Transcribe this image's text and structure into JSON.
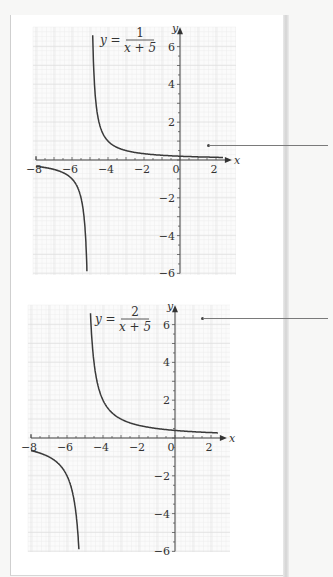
{
  "chart_data": [
    {
      "type": "line",
      "title": "",
      "equation_label": {
        "lhs": "y =",
        "numerator": "1",
        "denominator": "x + 5"
      },
      "function": "y = 1/(x+5)",
      "xlabel": "x",
      "ylabel": "y",
      "xlim": [
        -8,
        2.4
      ],
      "ylim": [
        -6,
        6.5
      ],
      "x_ticks": [
        -8,
        -6,
        -4,
        -2,
        0,
        2
      ],
      "x_tick_labels": [
        "−8",
        "−6",
        "−4",
        "−2",
        "0",
        "2"
      ],
      "y_ticks": [
        6,
        4,
        2,
        -2,
        -4,
        -6
      ],
      "y_tick_labels": [
        "6",
        "4",
        "2",
        "−2",
        "−4",
        "−6"
      ],
      "grid": true,
      "vertical_asymptote": -5,
      "horizontal_asymptote": 0,
      "series": [
        {
          "name": "right branch",
          "x": [
            -4.85,
            -4.8,
            -4.7,
            -4.5,
            -4,
            -3,
            -2,
            -1,
            0,
            1,
            2,
            2.4
          ],
          "y": [
            6.67,
            5,
            3.33,
            2,
            1,
            0.5,
            0.33,
            0.25,
            0.2,
            0.17,
            0.14,
            0.14
          ]
        },
        {
          "name": "left branch",
          "x": [
            -8,
            -7,
            -6,
            -5.5,
            -5.3,
            -5.2,
            -5.17
          ],
          "y": [
            -0.33,
            -0.5,
            -1,
            -2,
            -3.33,
            -5,
            -6
          ]
        }
      ]
    },
    {
      "type": "line",
      "title": "",
      "equation_label": {
        "lhs": "y =",
        "numerator": "2",
        "denominator": "x + 5"
      },
      "function": "y = 2/(x+5)",
      "xlabel": "x",
      "ylabel": "y",
      "xlim": [
        -8,
        2.4
      ],
      "ylim": [
        -6,
        6.5
      ],
      "x_ticks": [
        -8,
        -6,
        -4,
        -2,
        0,
        2
      ],
      "x_tick_labels": [
        "−8",
        "−6",
        "−4",
        "−2",
        "0",
        "2"
      ],
      "y_ticks": [
        6,
        4,
        2,
        -2,
        -4,
        -6
      ],
      "y_tick_labels": [
        "6",
        "4",
        "2",
        "−2",
        "−4",
        "−6"
      ],
      "grid": true,
      "vertical_asymptote": -5,
      "horizontal_asymptote": 0,
      "series": [
        {
          "name": "right branch",
          "x": [
            -4.69,
            -4.6,
            -4.5,
            -4,
            -3,
            -2,
            -1,
            0,
            1,
            2,
            2.4
          ],
          "y": [
            6.5,
            5,
            4,
            2,
            1,
            0.67,
            0.5,
            0.4,
            0.33,
            0.29,
            0.27
          ]
        },
        {
          "name": "left branch",
          "x": [
            -8,
            -7,
            -6,
            -5.67,
            -5.5,
            -5.4,
            -5.33
          ],
          "y": [
            -0.67,
            -1,
            -2,
            -3,
            -4,
            -5,
            -6
          ]
        }
      ]
    }
  ]
}
